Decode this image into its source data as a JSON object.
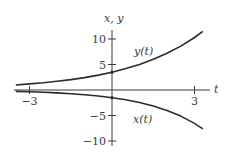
{
  "chart_data": {
    "type": "line",
    "title": "",
    "xlabel": "t",
    "ylabel": "x, y",
    "xlim": [
      -3.5,
      3.4
    ],
    "ylim": [
      -11,
      13
    ],
    "xticks": [
      -3,
      3
    ],
    "xtick_labels": [
      "−3",
      "3"
    ],
    "yticks": [
      10,
      5,
      -5,
      -10
    ],
    "ytick_labels": [
      "10",
      "5",
      "−5",
      "−10"
    ],
    "grid": false,
    "legend": "inline labels",
    "x": [
      -3.5,
      -3,
      -2.5,
      -2,
      -1.5,
      -1,
      -0.5,
      0,
      0.5,
      1,
      1.5,
      2,
      2.5,
      3,
      3.3
    ],
    "series": [
      {
        "name": "y(t)",
        "label": "y(t)",
        "values": [
          0.99,
          1.19,
          1.42,
          1.7,
          2.04,
          2.44,
          2.92,
          3.5,
          4.19,
          5.02,
          6.01,
          7.19,
          8.61,
          10.3,
          11.5
        ]
      },
      {
        "name": "x(t)",
        "label": "x(t)",
        "values": [
          -0.27,
          -0.34,
          -0.44,
          -0.56,
          -0.72,
          -0.92,
          -1.17,
          -1.5,
          -1.92,
          -2.45,
          -3.13,
          -4.0,
          -5.12,
          -6.54,
          -7.6
        ]
      }
    ]
  },
  "colors": {
    "curve": "#2b2b2b",
    "axis": "#3a3a3a",
    "background": "#ffffff"
  }
}
